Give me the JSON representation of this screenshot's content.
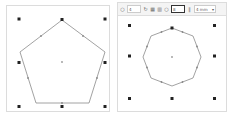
{
  "left_panel": {
    "shape": "pentagon",
    "sides": 5,
    "stroke_color": "#888888",
    "handle_color": "#222222"
  },
  "right_panel": {
    "toolbar": {
      "corners_icon": "polygon-icon",
      "corners_value": "4",
      "rotate_icon": "rotate-icon",
      "grid_icon": "grid-icon",
      "align_icon": "align-icon",
      "sides_icon": "polygon-icon",
      "sides_value": "8",
      "stroke_icon": "stroke-width-icon",
      "stroke_value": "4 mm",
      "dropdown_icon": "chevron-down-icon"
    },
    "shape": "octagon",
    "sides": 8,
    "stroke_color": "#888888",
    "handle_color": "#222222"
  }
}
